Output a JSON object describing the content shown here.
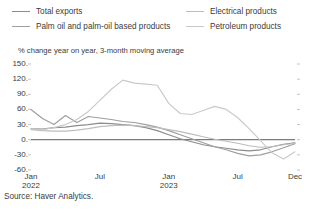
{
  "legend": {
    "left": [
      {
        "label": "Total exports",
        "color": "#8c8c8c",
        "key": "total_exports"
      },
      {
        "label": "Palm oil and palm-oil based products",
        "color": "#9e9e9e",
        "key": "palm_oil"
      }
    ],
    "right": [
      {
        "label": "Electrical products",
        "color": "#bdbdbd",
        "key": "electrical"
      },
      {
        "label": "Petroleum products",
        "color": "#c9c9c9",
        "key": "petroleum"
      }
    ]
  },
  "axis": {
    "title": "% change year on year, 3-month moving average",
    "yticks": [
      "150.",
      "120.",
      "90.",
      "60.",
      "30.",
      "0.",
      "-30.",
      "-60."
    ],
    "xticks": [
      {
        "label": "Jan",
        "year": "2022"
      },
      {
        "label": "Jul",
        "year": ""
      },
      {
        "label": "Jan",
        "year": "2023"
      },
      {
        "label": "Jul",
        "year": ""
      },
      {
        "label": "Dec",
        "year": ""
      }
    ]
  },
  "source": "Source: Haver Analytics.",
  "chart_data": {
    "type": "line",
    "title": "",
    "subtitle": "",
    "xlabel": "",
    "ylabel": "% change year on year, 3-month moving average",
    "ylim": [
      -60,
      150
    ],
    "yticks": [
      150,
      120,
      90,
      60,
      30,
      0,
      -30,
      -60
    ],
    "grid": false,
    "legend_position": "top",
    "x": [
      "Jan 2022",
      "Feb 2022",
      "Mar 2022",
      "Apr 2022",
      "May 2022",
      "Jun 2022",
      "Jul 2022",
      "Aug 2022",
      "Sep 2022",
      "Oct 2022",
      "Nov 2022",
      "Dec 2022",
      "Jan 2023",
      "Feb 2023",
      "Mar 2023",
      "Apr 2023",
      "May 2023",
      "Jun 2023",
      "Jul 2023",
      "Aug 2023",
      "Sep 2023",
      "Oct 2023",
      "Nov 2023",
      "Dec 2023"
    ],
    "xtick_labels": [
      "Jan 2022",
      "Jul",
      "Jan 2023",
      "Jul",
      "Dec"
    ],
    "series": [
      {
        "name": "Total exports",
        "color": "#8c8c8c",
        "values": [
          22,
          21,
          24,
          25,
          28,
          30,
          33,
          32,
          30,
          28,
          24,
          18,
          10,
          2,
          -4,
          -10,
          -14,
          -17,
          -20,
          -22,
          -20,
          -14,
          -9,
          -6
        ]
      },
      {
        "name": "Palm oil and palm-oil based products",
        "color": "#9e9e9e",
        "values": [
          60,
          42,
          30,
          48,
          34,
          46,
          43,
          40,
          36,
          34,
          30,
          25,
          18,
          10,
          2,
          -6,
          -14,
          -20,
          -27,
          -32,
          -30,
          -24,
          -16,
          -8
        ]
      },
      {
        "name": "Electrical products",
        "color": "#bdbdbd",
        "values": [
          20,
          18,
          17,
          17,
          19,
          22,
          26,
          28,
          29,
          28,
          26,
          24,
          20,
          16,
          11,
          6,
          1,
          -3,
          -7,
          -12,
          -15,
          -14,
          -10,
          -7
        ]
      },
      {
        "name": "Petroleum products",
        "color": "#c9c9c9",
        "values": [
          22,
          20,
          24,
          30,
          40,
          56,
          78,
          100,
          118,
          112,
          110,
          108,
          72,
          52,
          50,
          58,
          66,
          60,
          44,
          22,
          -2,
          -26,
          -38,
          -24
        ]
      }
    ]
  }
}
